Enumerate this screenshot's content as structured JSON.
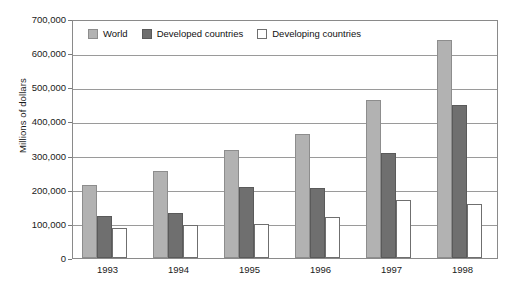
{
  "chart_data": {
    "type": "bar",
    "title": "",
    "subtitle": "",
    "xlabel": "",
    "ylabel": "Millions of dollars",
    "categories": [
      "1993",
      "1994",
      "1995",
      "1996",
      "1997",
      "1998"
    ],
    "series": [
      {
        "name": "World",
        "color": "#b2b2b2",
        "values": [
          213000,
          256000,
          317000,
          362000,
          463000,
          638000
        ]
      },
      {
        "name": "Developed countries",
        "color": "#6f6f6f",
        "values": [
          122000,
          133000,
          209000,
          205000,
          307000,
          447000
        ]
      },
      {
        "name": "Developing countries",
        "color": "#ffffff",
        "values": [
          89000,
          97000,
          99000,
          121000,
          169000,
          159000
        ]
      }
    ],
    "ylim": [
      0,
      700000
    ],
    "ytick_values": [
      0,
      100000,
      200000,
      300000,
      400000,
      500000,
      600000,
      700000
    ],
    "ytick_labels": [
      "0",
      "100,000",
      "200,000",
      "300,000",
      "400,000",
      "500,000",
      "600,000",
      "700,000"
    ],
    "grid": true,
    "legend_position": "top-left-inside"
  },
  "legend": {
    "items": [
      {
        "label": "World",
        "swatch": "world"
      },
      {
        "label": "Developed countries",
        "swatch": "developed"
      },
      {
        "label": "Developing countries",
        "swatch": "developing"
      }
    ]
  }
}
